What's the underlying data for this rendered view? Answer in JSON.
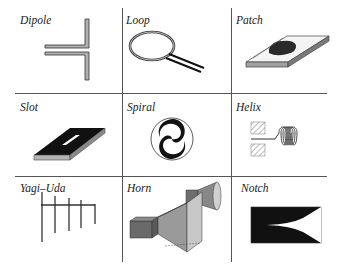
{
  "figure": {
    "type": "antenna-types-grid",
    "rows": 3,
    "cols": 3,
    "cells": [
      {
        "label": "Dipole"
      },
      {
        "label": "Loop"
      },
      {
        "label": "Patch"
      },
      {
        "label": "Slot"
      },
      {
        "label": "Spiral"
      },
      {
        "label": "Helix"
      },
      {
        "label": "Yagi–Uda"
      },
      {
        "label": "Horn"
      },
      {
        "label": "Notch"
      }
    ]
  },
  "colors": {
    "grid": "#555555",
    "ink": "#111111",
    "metal_gray": "#a8a8a8",
    "dark_gray": "#6a6a6a"
  }
}
